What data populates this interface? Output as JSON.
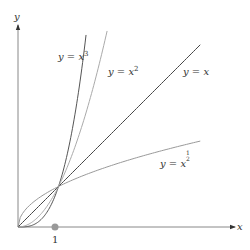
{
  "chart_data": {
    "type": "line",
    "title": "",
    "xlabel": "x",
    "ylabel": "y",
    "xlim": [
      0,
      5.4
    ],
    "ylim": [
      0,
      5.0
    ],
    "grid": false,
    "legend": "inline labels",
    "x_ticks": [
      {
        "value": 1,
        "label": "1",
        "marker": "filled-circle"
      }
    ],
    "series": [
      {
        "name": "y = x^3",
        "label_text": "y = x",
        "exponent_text": "3",
        "exponent": 3,
        "x_range": [
          0,
          1.68
        ],
        "color": "#555555"
      },
      {
        "name": "y = x^2",
        "label_text": "y = x",
        "exponent_text": "2",
        "exponent": 2,
        "x_range": [
          0,
          2.2
        ],
        "color": "#aaaaaa"
      },
      {
        "name": "y = x",
        "label_text": "y = x",
        "exponent_text": "",
        "exponent": 1,
        "x_range": [
          0,
          4.5
        ],
        "color": "#444444"
      },
      {
        "name": "y = x^(1/2)",
        "label_text": "y = x",
        "exponent_text": "1/2",
        "exponent": 0.5,
        "x_range": [
          0,
          4.5
        ],
        "color": "#999999"
      }
    ],
    "intersection_points": [
      [
        0,
        0
      ],
      [
        1,
        1
      ]
    ]
  },
  "labels": {
    "x_axis": "x",
    "y_axis": "y",
    "tick_one": "1",
    "cube_base": "y = x",
    "cube_exp": "3",
    "square_base": "y = x",
    "square_exp": "2",
    "linear": "y = x",
    "sqrt_base": "y = x",
    "sqrt_num": "1",
    "sqrt_den": "2"
  }
}
